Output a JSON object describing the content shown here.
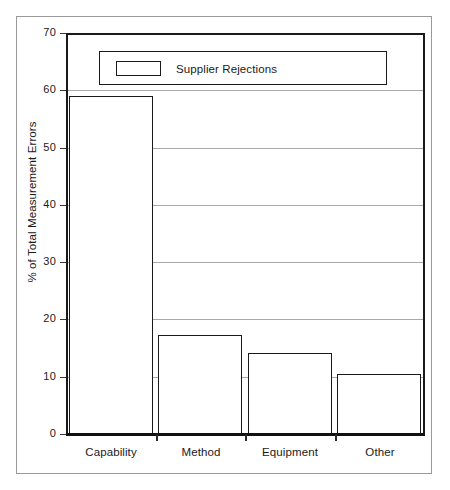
{
  "chart_data": {
    "type": "bar",
    "title": "",
    "subtitle": "",
    "xlabel": "",
    "ylabel": "% of Total Measurement Errors",
    "categories": [
      "Capability",
      "Method",
      "Equipment",
      "Other"
    ],
    "values": [
      59,
      17.2,
      14.2,
      10.5
    ],
    "series": [
      {
        "name": "Supplier Rejections",
        "values": [
          59,
          17.2,
          14.2,
          10.5
        ]
      }
    ],
    "ylim": [
      0,
      70
    ],
    "ytick_values": [
      0,
      10,
      20,
      30,
      40,
      50,
      60,
      70
    ],
    "ytick_labels": [
      "0",
      "10",
      "20",
      "30",
      "40",
      "50",
      "60",
      "70"
    ],
    "grid": "horizontal",
    "legend_position": "top-inside",
    "legend_entries": [
      "Supplier Rejections"
    ],
    "bar_fill_color": "#ffffff",
    "bar_edge_color": "#1a1a1a",
    "grid_color": "#a8a8a8",
    "axis_color": "#1a1a1a",
    "background_color": "#ffffff",
    "frame_color": "#9a9a9a"
  },
  "legend": {
    "label": "Supplier Rejections",
    "swatch_name": "legend-swatch-supplier-rejections"
  },
  "axes": {
    "y_title": "% of Total Measurement Errors",
    "y_ticks": [
      "70",
      "60",
      "50",
      "40",
      "30",
      "20",
      "10",
      "0"
    ],
    "x_ticks": [
      "Capability",
      "Method",
      "Equipment",
      "Other"
    ]
  }
}
